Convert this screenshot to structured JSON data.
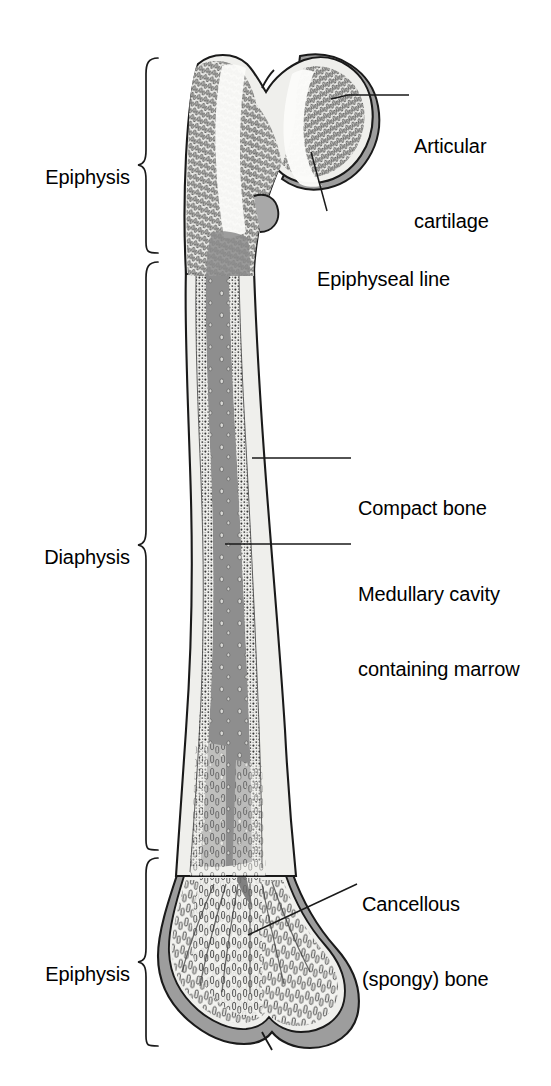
{
  "figure": {
    "width": 551,
    "height": 1086,
    "background": "#ffffff"
  },
  "region_labels": [
    {
      "id": "epiphysis-proximal",
      "text": "Epiphysis",
      "x": 36,
      "y": 152,
      "brace": {
        "top": 58,
        "bottom": 253,
        "tip_y": 165,
        "x": 140
      }
    },
    {
      "id": "diaphysis",
      "text": "Diaphysis",
      "x": 38,
      "y": 532,
      "brace": {
        "top": 262,
        "bottom": 850,
        "tip_y": 545,
        "x": 140
      }
    },
    {
      "id": "epiphysis-distal",
      "text": "Epiphysis",
      "x": 36,
      "y": 952,
      "brace": {
        "top": 858,
        "bottom": 1046,
        "tip_y": 962,
        "x": 140
      }
    }
  ],
  "callouts": [
    {
      "id": "articular-cartilage",
      "lines": [
        "Articular",
        "cartilage"
      ],
      "x": 414,
      "y": 86,
      "leader": {
        "points": "338,95 409,95",
        "anchor": "330,100"
      }
    },
    {
      "id": "epiphyseal-line",
      "lines": [
        "Epiphyseal line"
      ],
      "x": 317,
      "y": 218,
      "leader": {
        "points": "311,152 327,211",
        "anchor": "311,152"
      }
    },
    {
      "id": "compact-bone",
      "lines": [
        "Compact bone"
      ],
      "x": 358,
      "y": 446,
      "leader": {
        "points": "252,458 351,458",
        "anchor": "252,458"
      }
    },
    {
      "id": "medullary-cavity",
      "lines": [
        "Medullary cavity",
        "containing marrow"
      ],
      "x": 358,
      "y": 532,
      "leader": {
        "points": "225,544 351,544",
        "anchor": "225,544"
      }
    },
    {
      "id": "cancellous-bone",
      "lines": [
        "Cancellous",
        "(spongy) bone"
      ],
      "x": 362,
      "y": 843,
      "leader": {
        "points": "248,935 357,884",
        "anchor": "248,935"
      }
    }
  ],
  "colors": {
    "outline": "#1a1a1a",
    "cartilage_gray": "#9a9a9a",
    "cartilage_gray_light": "#b5b5b5",
    "cortex_light": "#efefec",
    "marrow_gray": "#8e8e8e",
    "trabecula_fill": "#e6e6e4",
    "trabecula_stroke": "#3a3a3a",
    "dense_spongy": "#4a4a4a",
    "text": "#000000",
    "background": "#ffffff"
  },
  "anatomy_parts": [
    {
      "name": "femoral-head",
      "description": "rounded proximal head covered by articular cartilage"
    },
    {
      "name": "greater-trochanter",
      "description": "lateral proximal prominence"
    },
    {
      "name": "femoral-neck",
      "description": "region between head and shaft"
    },
    {
      "name": "lesser-trochanter",
      "description": "small medial prominence"
    },
    {
      "name": "proximal-epiphyseal-line",
      "description": "white band across the head"
    },
    {
      "name": "compact-bone-cortex",
      "description": "dense outer shell of the shaft"
    },
    {
      "name": "medullary-cavity",
      "description": "central marrow-filled canal"
    },
    {
      "name": "cancellous-bone",
      "description": "trabecular spongy bone in both epiphyses"
    },
    {
      "name": "distal-condyles",
      "description": "two rounded distal articular surfaces"
    }
  ]
}
